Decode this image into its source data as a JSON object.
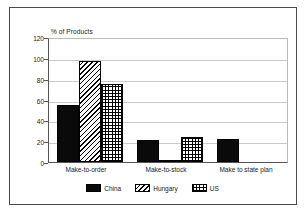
{
  "chart_data": {
    "type": "bar",
    "title": "",
    "subtitle": "",
    "xlabel": "",
    "ylabel": "% of Products",
    "ylim": [
      0,
      120
    ],
    "ytick_labels": [
      "0",
      "20",
      "40",
      "60",
      "80",
      "100",
      "120"
    ],
    "ytick_values": [
      0,
      20,
      40,
      60,
      80,
      100,
      120
    ],
    "grid": true,
    "legend_position": "bottom",
    "categories": [
      "Make-to-order",
      "Make-to-stock",
      "Make to state plan"
    ],
    "series": [
      {
        "name": "China",
        "pattern": "solid-black",
        "values": [
          55,
          21,
          22
        ]
      },
      {
        "name": "Hungary",
        "pattern": "diagonal-hatch",
        "values": [
          97,
          2,
          0
        ]
      },
      {
        "name": "US",
        "pattern": "crosshatch",
        "values": [
          75,
          24,
          0
        ]
      }
    ]
  },
  "legend": {
    "items": [
      {
        "label": "China"
      },
      {
        "label": "Hungary"
      },
      {
        "label": "US"
      }
    ]
  },
  "colors": {
    "ink": "#0a0a0a",
    "grid": "#c9c9c9",
    "axis": "#555555",
    "frame": "#4a4a4a",
    "background": "#ffffff"
  }
}
